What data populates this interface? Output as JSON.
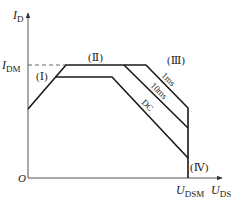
{
  "diagram": {
    "y_axis": {
      "symbol": "I",
      "subscript": "D"
    },
    "x_axis": {
      "symbol": "U",
      "subscript": "DS"
    },
    "origin": "O",
    "idm": {
      "symbol": "I",
      "subscript": "DM"
    },
    "udsm": {
      "symbol": "U",
      "subscript": "DSM"
    },
    "regions": {
      "r1": "(Ⅰ)",
      "r2": "(Ⅱ)",
      "r3": "(Ⅲ)",
      "r4": "(Ⅳ)"
    },
    "curves": {
      "c1": "1ms",
      "c2": "10ms",
      "c3": "DC"
    },
    "colors": {
      "line": "#1a1a1a",
      "axis": "#555555"
    }
  }
}
